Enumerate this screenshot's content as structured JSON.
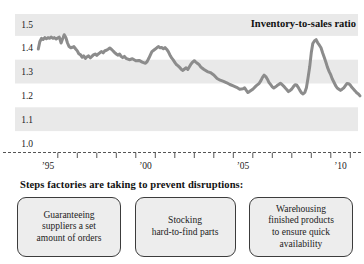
{
  "chart": {
    "colors": {
      "line": "#8c8c8c",
      "band": "#e9e9e9",
      "axis": "#555555",
      "text": "#1a1a1a"
    }
  },
  "chart_data": {
    "type": "line",
    "title": "Inventory-to-sales ratio",
    "xlabel": "",
    "ylabel": "",
    "ylim": [
      1.0,
      1.5
    ],
    "grid": "alternating horizontal shaded bands",
    "legend_position": "title-top-right",
    "yticks": [
      {
        "v": 1.5,
        "label": "1.5"
      },
      {
        "v": 1.4,
        "label": "1.4"
      },
      {
        "v": 1.3,
        "label": "1.3"
      },
      {
        "v": 1.2,
        "label": "1.2"
      },
      {
        "v": 1.1,
        "label": "1.1"
      },
      {
        "v": 1.0,
        "label": "1.0"
      }
    ],
    "xticks": [
      {
        "year": 1995,
        "label": "’95"
      },
      {
        "year": 2000,
        "label": "’00"
      },
      {
        "year": 2005,
        "label": "’05"
      },
      {
        "year": 2010,
        "label": "’10"
      }
    ],
    "minor_tick_years": [
      1995.5,
      1996.5,
      1997.5,
      1998.5,
      1999.5,
      2000.5,
      2001.5,
      2002.5,
      2003.5,
      2004.5,
      2005.5,
      2006.5,
      2007.5,
      2008.5,
      2009.5,
      2010.5
    ],
    "shaded_bands": [
      [
        1.55,
        1.45
      ],
      [
        1.35,
        1.25
      ],
      [
        1.15,
        1.05
      ]
    ],
    "points": [
      [
        1994.5,
        1.395
      ],
      [
        1994.58,
        1.425
      ],
      [
        1994.67,
        1.44
      ],
      [
        1994.75,
        1.435
      ],
      [
        1994.83,
        1.443
      ],
      [
        1994.92,
        1.438
      ],
      [
        1995.0,
        1.443
      ],
      [
        1995.08,
        1.44
      ],
      [
        1995.17,
        1.445
      ],
      [
        1995.25,
        1.44
      ],
      [
        1995.33,
        1.443
      ],
      [
        1995.42,
        1.437
      ],
      [
        1995.5,
        1.442
      ],
      [
        1995.58,
        1.445
      ],
      [
        1995.67,
        1.42
      ],
      [
        1995.75,
        1.438
      ],
      [
        1995.83,
        1.455
      ],
      [
        1995.92,
        1.442
      ],
      [
        1996.0,
        1.42
      ],
      [
        1996.08,
        1.405
      ],
      [
        1996.17,
        1.4
      ],
      [
        1996.25,
        1.402
      ],
      [
        1996.33,
        1.405
      ],
      [
        1996.42,
        1.395
      ],
      [
        1996.5,
        1.387
      ],
      [
        1996.58,
        1.375
      ],
      [
        1996.67,
        1.37
      ],
      [
        1996.75,
        1.36
      ],
      [
        1996.83,
        1.366
      ],
      [
        1996.92,
        1.355
      ],
      [
        1997.0,
        1.362
      ],
      [
        1997.08,
        1.366
      ],
      [
        1997.17,
        1.358
      ],
      [
        1997.25,
        1.364
      ],
      [
        1997.33,
        1.37
      ],
      [
        1997.42,
        1.374
      ],
      [
        1997.5,
        1.368
      ],
      [
        1997.58,
        1.374
      ],
      [
        1997.67,
        1.38
      ],
      [
        1997.75,
        1.384
      ],
      [
        1997.83,
        1.379
      ],
      [
        1997.92,
        1.388
      ],
      [
        1998.0,
        1.39
      ],
      [
        1998.08,
        1.394
      ],
      [
        1998.17,
        1.399
      ],
      [
        1998.25,
        1.394
      ],
      [
        1998.33,
        1.388
      ],
      [
        1998.42,
        1.38
      ],
      [
        1998.5,
        1.374
      ],
      [
        1998.58,
        1.369
      ],
      [
        1998.67,
        1.374
      ],
      [
        1998.75,
        1.364
      ],
      [
        1998.83,
        1.359
      ],
      [
        1998.92,
        1.364
      ],
      [
        1999.0,
        1.356
      ],
      [
        1999.17,
        1.35
      ],
      [
        1999.33,
        1.354
      ],
      [
        1999.5,
        1.346
      ],
      [
        1999.67,
        1.347
      ],
      [
        1999.83,
        1.34
      ],
      [
        2000.0,
        1.335
      ],
      [
        2000.08,
        1.342
      ],
      [
        2000.17,
        1.356
      ],
      [
        2000.25,
        1.37
      ],
      [
        2000.33,
        1.384
      ],
      [
        2000.42,
        1.39
      ],
      [
        2000.5,
        1.395
      ],
      [
        2000.58,
        1.4
      ],
      [
        2000.67,
        1.405
      ],
      [
        2000.75,
        1.4
      ],
      [
        2000.83,
        1.401
      ],
      [
        2000.92,
        1.396
      ],
      [
        2001.0,
        1.401
      ],
      [
        2001.08,
        1.394
      ],
      [
        2001.17,
        1.384
      ],
      [
        2001.25,
        1.37
      ],
      [
        2001.33,
        1.359
      ],
      [
        2001.42,
        1.349
      ],
      [
        2001.5,
        1.339
      ],
      [
        2001.58,
        1.33
      ],
      [
        2001.67,
        1.324
      ],
      [
        2001.75,
        1.318
      ],
      [
        2001.83,
        1.31
      ],
      [
        2001.92,
        1.305
      ],
      [
        2002.0,
        1.311
      ],
      [
        2002.08,
        1.316
      ],
      [
        2002.17,
        1.309
      ],
      [
        2002.25,
        1.32
      ],
      [
        2002.33,
        1.331
      ],
      [
        2002.42,
        1.34
      ],
      [
        2002.5,
        1.346
      ],
      [
        2002.58,
        1.34
      ],
      [
        2002.67,
        1.334
      ],
      [
        2002.75,
        1.329
      ],
      [
        2002.83,
        1.32
      ],
      [
        2002.92,
        1.314
      ],
      [
        2003.0,
        1.309
      ],
      [
        2003.17,
        1.3
      ],
      [
        2003.33,
        1.296
      ],
      [
        2003.5,
        1.286
      ],
      [
        2003.67,
        1.271
      ],
      [
        2003.83,
        1.264
      ],
      [
        2004.0,
        1.259
      ],
      [
        2004.17,
        1.253
      ],
      [
        2004.33,
        1.246
      ],
      [
        2004.5,
        1.24
      ],
      [
        2004.67,
        1.234
      ],
      [
        2004.83,
        1.226
      ],
      [
        2005.0,
        1.228
      ],
      [
        2005.08,
        1.232
      ],
      [
        2005.17,
        1.221
      ],
      [
        2005.25,
        1.212
      ],
      [
        2005.33,
        1.216
      ],
      [
        2005.5,
        1.226
      ],
      [
        2005.67,
        1.24
      ],
      [
        2005.83,
        1.251
      ],
      [
        2005.92,
        1.262
      ],
      [
        2006.0,
        1.276
      ],
      [
        2006.08,
        1.285
      ],
      [
        2006.17,
        1.279
      ],
      [
        2006.25,
        1.268
      ],
      [
        2006.33,
        1.255
      ],
      [
        2006.42,
        1.245
      ],
      [
        2006.5,
        1.236
      ],
      [
        2006.58,
        1.231
      ],
      [
        2006.67,
        1.236
      ],
      [
        2006.75,
        1.241
      ],
      [
        2006.83,
        1.246
      ],
      [
        2006.92,
        1.251
      ],
      [
        2007.0,
        1.246
      ],
      [
        2007.08,
        1.239
      ],
      [
        2007.17,
        1.231
      ],
      [
        2007.25,
        1.224
      ],
      [
        2007.33,
        1.216
      ],
      [
        2007.42,
        1.221
      ],
      [
        2007.5,
        1.227
      ],
      [
        2007.58,
        1.236
      ],
      [
        2007.67,
        1.245
      ],
      [
        2007.75,
        1.244
      ],
      [
        2007.83,
        1.234
      ],
      [
        2007.92,
        1.221
      ],
      [
        2008.0,
        1.211
      ],
      [
        2008.08,
        1.206
      ],
      [
        2008.17,
        1.212
      ],
      [
        2008.25,
        1.232
      ],
      [
        2008.33,
        1.27
      ],
      [
        2008.42,
        1.32
      ],
      [
        2008.5,
        1.38
      ],
      [
        2008.58,
        1.418
      ],
      [
        2008.67,
        1.43
      ],
      [
        2008.75,
        1.434
      ],
      [
        2008.83,
        1.421
      ],
      [
        2008.92,
        1.411
      ],
      [
        2009.0,
        1.4
      ],
      [
        2009.08,
        1.379
      ],
      [
        2009.17,
        1.359
      ],
      [
        2009.25,
        1.339
      ],
      [
        2009.33,
        1.319
      ],
      [
        2009.42,
        1.3
      ],
      [
        2009.5,
        1.286
      ],
      [
        2009.58,
        1.269
      ],
      [
        2009.67,
        1.254
      ],
      [
        2009.75,
        1.241
      ],
      [
        2009.83,
        1.231
      ],
      [
        2009.92,
        1.226
      ],
      [
        2010.0,
        1.221
      ],
      [
        2010.08,
        1.226
      ],
      [
        2010.17,
        1.232
      ],
      [
        2010.25,
        1.241
      ],
      [
        2010.33,
        1.25
      ],
      [
        2010.42,
        1.249
      ],
      [
        2010.5,
        1.243
      ],
      [
        2010.58,
        1.234
      ],
      [
        2010.67,
        1.226
      ],
      [
        2010.75,
        1.219
      ],
      [
        2010.83,
        1.211
      ],
      [
        2010.92,
        1.206
      ],
      [
        2011.0,
        1.198
      ]
    ]
  },
  "footer": {
    "heading": "Steps factories are taking to prevent disruptions:",
    "boxes": [
      "Guaranteeing\nsuppliers a set\namount of orders",
      "Stocking\nhard-to-find parts",
      "Warehousing\nfinished products\nto ensure quick\navailability"
    ]
  }
}
